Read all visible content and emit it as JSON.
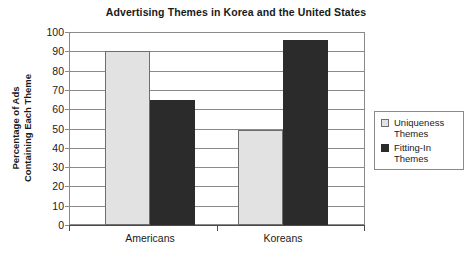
{
  "chart_data": {
    "type": "bar",
    "title": "Advertising Themes in Korea and the United States",
    "xlabel": "",
    "ylabel_line1": "Percentage of Ads",
    "ylabel_line2": "Containing Each Theme",
    "categories": [
      "Americans",
      "Koreans"
    ],
    "series": [
      {
        "name": "Uniqueness Themes",
        "name_line1": "Uniqueness",
        "name_line2": "Themes",
        "color": "#e2e2e2",
        "values": [
          90,
          49
        ]
      },
      {
        "name": "Fitting-In Themes",
        "name_line1": "Fitting-In",
        "name_line2": "Themes",
        "color": "#2b2b2b",
        "values": [
          65,
          96
        ]
      }
    ],
    "ylim": [
      0,
      100
    ],
    "yticks": [
      0,
      10,
      20,
      30,
      40,
      50,
      60,
      70,
      80,
      90,
      100
    ],
    "ytick_labels": [
      "0",
      "10",
      "20",
      "30",
      "40",
      "50",
      "60",
      "70",
      "80",
      "90",
      "100"
    ],
    "grid": true,
    "legend_position": "right"
  }
}
